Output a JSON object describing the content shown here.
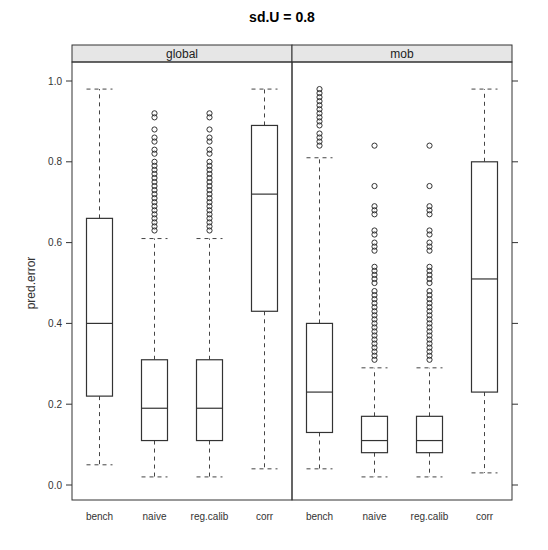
{
  "chart_data": {
    "type": "boxplot",
    "title": "sd.U =  0.8",
    "xlabel": "",
    "ylabel": "pred.error",
    "ylim": [
      0.0,
      1.0
    ],
    "yticks": [
      "0.0",
      "0.2",
      "0.4",
      "0.6",
      "0.8",
      "1.0"
    ],
    "grid": false,
    "categories": [
      "bench",
      "naive",
      "reg.calib",
      "corr"
    ],
    "panels": [
      {
        "name": "global",
        "boxes": [
          {
            "category": "bench",
            "whisker_low": 0.05,
            "q1": 0.22,
            "median": 0.4,
            "q3": 0.66,
            "whisker_high": 0.98,
            "outliers": []
          },
          {
            "category": "naive",
            "whisker_low": 0.02,
            "q1": 0.11,
            "median": 0.19,
            "q3": 0.31,
            "whisker_high": 0.61,
            "outliers": [
              0.63,
              0.64,
              0.65,
              0.66,
              0.67,
              0.68,
              0.69,
              0.7,
              0.71,
              0.72,
              0.73,
              0.74,
              0.75,
              0.76,
              0.77,
              0.78,
              0.79,
              0.8,
              0.82,
              0.83,
              0.85,
              0.86,
              0.88,
              0.91,
              0.92
            ]
          },
          {
            "category": "reg.calib",
            "whisker_low": 0.02,
            "q1": 0.11,
            "median": 0.19,
            "q3": 0.31,
            "whisker_high": 0.61,
            "outliers": [
              0.63,
              0.64,
              0.65,
              0.66,
              0.67,
              0.68,
              0.69,
              0.7,
              0.71,
              0.72,
              0.73,
              0.74,
              0.75,
              0.76,
              0.77,
              0.78,
              0.79,
              0.8,
              0.82,
              0.83,
              0.85,
              0.86,
              0.88,
              0.91,
              0.92
            ]
          },
          {
            "category": "corr",
            "whisker_low": 0.04,
            "q1": 0.43,
            "median": 0.72,
            "q3": 0.89,
            "whisker_high": 0.98,
            "outliers": []
          }
        ]
      },
      {
        "name": "mob",
        "boxes": [
          {
            "category": "bench",
            "whisker_low": 0.04,
            "q1": 0.13,
            "median": 0.23,
            "q3": 0.4,
            "whisker_high": 0.81,
            "outliers": [
              0.84,
              0.85,
              0.86,
              0.87,
              0.89,
              0.9,
              0.91,
              0.92,
              0.93,
              0.94,
              0.95,
              0.96,
              0.97,
              0.98
            ]
          },
          {
            "category": "naive",
            "whisker_low": 0.02,
            "q1": 0.08,
            "median": 0.11,
            "q3": 0.17,
            "whisker_high": 0.29,
            "outliers": [
              0.31,
              0.32,
              0.33,
              0.34,
              0.35,
              0.36,
              0.37,
              0.38,
              0.39,
              0.4,
              0.41,
              0.42,
              0.43,
              0.44,
              0.45,
              0.46,
              0.47,
              0.48,
              0.5,
              0.51,
              0.52,
              0.53,
              0.54,
              0.58,
              0.59,
              0.6,
              0.62,
              0.63,
              0.67,
              0.68,
              0.69,
              0.74,
              0.84
            ]
          },
          {
            "category": "reg.calib",
            "whisker_low": 0.02,
            "q1": 0.08,
            "median": 0.11,
            "q3": 0.17,
            "whisker_high": 0.29,
            "outliers": [
              0.31,
              0.32,
              0.33,
              0.34,
              0.35,
              0.36,
              0.37,
              0.38,
              0.39,
              0.4,
              0.41,
              0.42,
              0.43,
              0.44,
              0.45,
              0.46,
              0.47,
              0.48,
              0.5,
              0.51,
              0.52,
              0.53,
              0.54,
              0.58,
              0.59,
              0.6,
              0.62,
              0.63,
              0.67,
              0.68,
              0.69,
              0.74,
              0.84
            ]
          },
          {
            "category": "corr",
            "whisker_low": 0.03,
            "q1": 0.23,
            "median": 0.51,
            "q3": 0.8,
            "whisker_high": 0.98,
            "outliers": []
          }
        ]
      }
    ],
    "colors": {
      "strip_fill": "#e6e6e6",
      "frame": "#333333",
      "box": "#333333",
      "whisker": "#444444",
      "outlier": "#333333"
    }
  }
}
